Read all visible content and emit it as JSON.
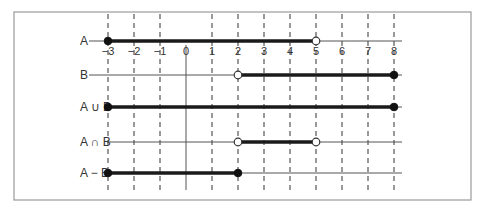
{
  "axis": {
    "min": -3,
    "max": 8,
    "ticks": [
      -3,
      -2,
      -1,
      0,
      1,
      2,
      3,
      4,
      5,
      6,
      7,
      8
    ],
    "tick_labels": [
      "−3",
      "−2",
      "−1",
      "0",
      "1",
      "2",
      "3",
      "4",
      "5",
      "6",
      "7",
      "8"
    ]
  },
  "rows": [
    {
      "label": "A",
      "interval": {
        "from": -3,
        "to": 5,
        "from_closed": true,
        "to_closed": false
      },
      "show_ticks": true
    },
    {
      "label": "B",
      "interval": {
        "from": 2,
        "to": 8,
        "from_closed": false,
        "to_closed": true
      }
    },
    {
      "label": "A ∪ B",
      "interval": {
        "from": -3,
        "to": 8,
        "from_closed": true,
        "to_closed": true
      }
    },
    {
      "label": "A ∩ B",
      "interval": {
        "from": 2,
        "to": 5,
        "from_closed": false,
        "to_closed": false
      }
    },
    {
      "label": "A − B",
      "interval": {
        "from": -3,
        "to": 2,
        "from_closed": true,
        "to_closed": true
      }
    }
  ],
  "colors": {
    "line": "#1a1a1a",
    "grid": "#333333",
    "frame": "#9a9a9a"
  }
}
